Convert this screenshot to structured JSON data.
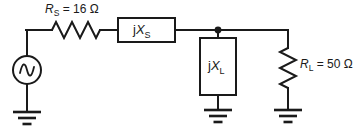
{
  "diagram": {
    "background_color": "#ffffff",
    "line_color": "#1a1a1a"
  },
  "labels": {
    "source_resistance": {
      "symbol": "R",
      "subscript": "S",
      "equals": " = ",
      "value": "16",
      "unit": "Ω",
      "full_text": "R_S = 16 Ω"
    },
    "load_resistance": {
      "symbol": "R",
      "subscript": "L",
      "equals": " = ",
      "value": "50",
      "unit": "Ω",
      "full_text": "R_L = 50 Ω"
    },
    "series_reactance": {
      "prefix": "j",
      "symbol": "X",
      "subscript": "S",
      "full_text": "jX_S"
    },
    "shunt_reactance": {
      "prefix": "j",
      "symbol": "X",
      "subscript": "L",
      "full_text": "jX_L"
    }
  },
  "components": [
    {
      "name": "ac-voltage-source",
      "kind": "ac-source",
      "icon": "sine-wave-icon"
    },
    {
      "name": "source-resistor",
      "kind": "resistor",
      "orientation": "horizontal"
    },
    {
      "name": "series-reactance-box",
      "kind": "reactance-box",
      "orientation": "horizontal"
    },
    {
      "name": "shunt-reactance-box",
      "kind": "reactance-box",
      "orientation": "vertical"
    },
    {
      "name": "load-resistor",
      "kind": "resistor",
      "orientation": "vertical"
    },
    {
      "name": "ground-source",
      "kind": "ground",
      "icon": "ground-icon"
    },
    {
      "name": "ground-shunt",
      "kind": "ground",
      "icon": "ground-icon"
    },
    {
      "name": "ground-load",
      "kind": "ground",
      "icon": "ground-icon"
    },
    {
      "name": "output-node",
      "kind": "junction-dot"
    }
  ]
}
